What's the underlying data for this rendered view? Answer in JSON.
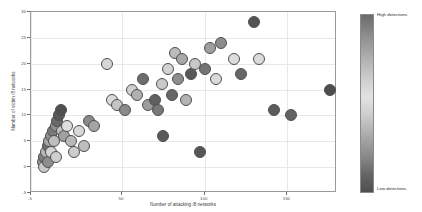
{
  "chart_data": {
    "type": "scatter",
    "title": "",
    "xlabel": "Number of attacking /8 networks",
    "ylabel": "Number of victim /8 networks",
    "xlim": [
      -5,
      180
    ],
    "ylim": [
      -5,
      30
    ],
    "xticks": [
      -5,
      50,
      100,
      150
    ],
    "xticklabels": [
      "-5",
      "50",
      "100",
      "150"
    ],
    "yticks": [
      -5,
      0,
      5,
      10,
      15,
      20,
      25,
      30
    ],
    "yticklabels": [
      "-5",
      "0",
      "5",
      "10",
      "15",
      "20",
      "25",
      "30"
    ],
    "grid": true,
    "legend": "colorbar-right",
    "colorbar": {
      "high_label": "High detections",
      "low_label": "Low detections",
      "high_color": "#6b6b6b",
      "mid_color": "#e2e2e2",
      "low_color": "#4e4e4e"
    },
    "marker": {
      "shape": "circle",
      "size_px": 12,
      "edge_color": "#505050",
      "colormap": "grayscale-detections"
    },
    "points": [
      {
        "x": 2,
        "y": 1,
        "color": "#9a9a9a"
      },
      {
        "x": 3,
        "y": 0,
        "color": "#c9c9c9"
      },
      {
        "x": 3,
        "y": 2,
        "color": "#7e7e7e"
      },
      {
        "x": 4,
        "y": 3,
        "color": "#b5b5b5"
      },
      {
        "x": 5,
        "y": 1,
        "color": "#8d8d8d"
      },
      {
        "x": 5,
        "y": 4,
        "color": "#6e6e6e"
      },
      {
        "x": 6,
        "y": 5,
        "color": "#a8a8a8"
      },
      {
        "x": 7,
        "y": 3,
        "color": "#d4d4d4"
      },
      {
        "x": 7,
        "y": 6,
        "color": "#939393"
      },
      {
        "x": 8,
        "y": 7,
        "color": "#7a7a7a"
      },
      {
        "x": 9,
        "y": 5,
        "color": "#bdbdbd"
      },
      {
        "x": 10,
        "y": 8,
        "color": "#8f8f8f"
      },
      {
        "x": 10,
        "y": 2,
        "color": "#cfcfcf"
      },
      {
        "x": 11,
        "y": 9,
        "color": "#6a6a6a"
      },
      {
        "x": 12,
        "y": 10,
        "color": "#585858"
      },
      {
        "x": 13,
        "y": 11,
        "color": "#4f4f4f"
      },
      {
        "x": 14,
        "y": 7,
        "color": "#c2c2c2"
      },
      {
        "x": 15,
        "y": 6,
        "color": "#a0a0a0"
      },
      {
        "x": 17,
        "y": 8,
        "color": "#dedede"
      },
      {
        "x": 19,
        "y": 5,
        "color": "#b8b8b8"
      },
      {
        "x": 21,
        "y": 3,
        "color": "#cdcdcd"
      },
      {
        "x": 24,
        "y": 7,
        "color": "#d8d8d8"
      },
      {
        "x": 27,
        "y": 4,
        "color": "#bebebe"
      },
      {
        "x": 30,
        "y": 9,
        "color": "#8b8b8b"
      },
      {
        "x": 33,
        "y": 8,
        "color": "#a4a4a4"
      },
      {
        "x": 41,
        "y": 20,
        "color": "#d6d6d6"
      },
      {
        "x": 44,
        "y": 13,
        "color": "#dadada"
      },
      {
        "x": 47,
        "y": 12,
        "color": "#c4c4c4"
      },
      {
        "x": 52,
        "y": 11,
        "color": "#8a8a8a"
      },
      {
        "x": 56,
        "y": 15,
        "color": "#d0d0d0"
      },
      {
        "x": 59,
        "y": 14,
        "color": "#b0b0b0"
      },
      {
        "x": 63,
        "y": 17,
        "color": "#6d6d6d"
      },
      {
        "x": 66,
        "y": 12,
        "color": "#9c9c9c"
      },
      {
        "x": 70,
        "y": 13,
        "color": "#5f5f5f"
      },
      {
        "x": 72,
        "y": 11,
        "color": "#787878"
      },
      {
        "x": 74,
        "y": 16,
        "color": "#cacaca"
      },
      {
        "x": 75,
        "y": 6,
        "color": "#5a5a5a"
      },
      {
        "x": 78,
        "y": 19,
        "color": "#d2d2d2"
      },
      {
        "x": 80,
        "y": 14,
        "color": "#676767"
      },
      {
        "x": 82,
        "y": 22,
        "color": "#bcbcbc"
      },
      {
        "x": 84,
        "y": 17,
        "color": "#8e8e8e"
      },
      {
        "x": 86,
        "y": 21,
        "color": "#a9a9a9"
      },
      {
        "x": 89,
        "y": 13,
        "color": "#b3b3b3"
      },
      {
        "x": 92,
        "y": 18,
        "color": "#595959"
      },
      {
        "x": 94,
        "y": 20,
        "color": "#c7c7c7"
      },
      {
        "x": 97,
        "y": 3,
        "color": "#565656"
      },
      {
        "x": 100,
        "y": 19,
        "color": "#747474"
      },
      {
        "x": 103,
        "y": 23,
        "color": "#9e9e9e"
      },
      {
        "x": 107,
        "y": 17,
        "color": "#d9d9d9"
      },
      {
        "x": 110,
        "y": 24,
        "color": "#8c8c8c"
      },
      {
        "x": 118,
        "y": 21,
        "color": "#dcdcdc"
      },
      {
        "x": 122,
        "y": 18,
        "color": "#666666"
      },
      {
        "x": 130,
        "y": 28,
        "color": "#535353"
      },
      {
        "x": 133,
        "y": 21,
        "color": "#dbdbdb"
      },
      {
        "x": 142,
        "y": 11,
        "color": "#5c5c5c"
      },
      {
        "x": 152,
        "y": 10,
        "color": "#636363"
      },
      {
        "x": 176,
        "y": 15,
        "color": "#4d4d4d"
      }
    ]
  }
}
